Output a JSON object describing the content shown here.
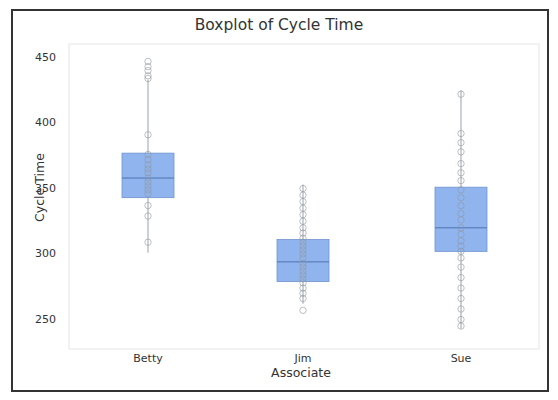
{
  "chart_data": {
    "type": "box",
    "title": "Boxplot of Cycle Time",
    "xlabel": "Associate",
    "ylabel": "Cycle Time",
    "categories": [
      "Betty",
      "Jim",
      "Sue"
    ],
    "yticks": [
      250,
      300,
      350,
      400,
      450
    ],
    "ylim": [
      227,
      455
    ],
    "grid": false,
    "legend": null,
    "box_color": "#8fb4ee",
    "box_edge_color": "#6f93cf",
    "series": [
      {
        "name": "Betty",
        "whisker_low": 301,
        "q1": 343,
        "median": 358,
        "q3": 377,
        "whisker_high": 433,
        "points": [
          447,
          443,
          440,
          436,
          434,
          391,
          376,
          372,
          368,
          365,
          362,
          358,
          355,
          352,
          349,
          346,
          337,
          329,
          309
        ]
      },
      {
        "name": "Jim",
        "whisker_low": 262,
        "q1": 279,
        "median": 294,
        "q3": 311,
        "whisker_high": 353,
        "points": [
          350,
          345,
          340,
          335,
          330,
          325,
          320,
          316,
          312,
          309,
          306,
          303,
          300,
          297,
          293,
          290,
          287,
          284,
          281,
          278,
          274,
          270,
          266,
          257
        ]
      },
      {
        "name": "Sue",
        "whisker_low": 243,
        "q1": 302,
        "median": 320,
        "q3": 351,
        "whisker_high": 425,
        "points": [
          422,
          392,
          385,
          378,
          369,
          362,
          356,
          349,
          343,
          337,
          331,
          326,
          320,
          315,
          310,
          306,
          302,
          297,
          290,
          282,
          274,
          266,
          258,
          250,
          245
        ]
      }
    ]
  }
}
